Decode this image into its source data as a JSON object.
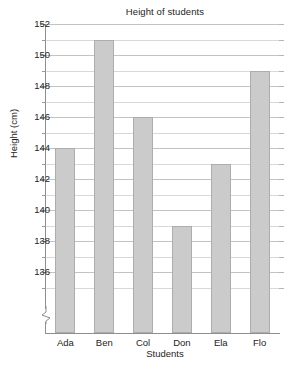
{
  "chart_data": {
    "type": "bar",
    "title": "Height of students",
    "xlabel": "Students",
    "ylabel": "Height (cm)",
    "categories": [
      "Ada",
      "Ben",
      "Col",
      "Don",
      "Ela",
      "Flo"
    ],
    "values": [
      144,
      151,
      146,
      139,
      143,
      149
    ],
    "ylim": [
      134,
      152.5
    ],
    "ytick_labels": [
      "152",
      "150",
      "148",
      "146",
      "144",
      "142",
      "140",
      "138",
      "136"
    ],
    "ytick_values": [
      152,
      150,
      148,
      146,
      144,
      142,
      140,
      138,
      136
    ],
    "minor_tick_step": 1,
    "grid": true,
    "legend": null,
    "axis_break": true,
    "bar_color": "#cbcbcb",
    "bar_border_color": "#adadad",
    "grid_color": "#c3c3c3",
    "axis_color": "#8e8e8e"
  }
}
